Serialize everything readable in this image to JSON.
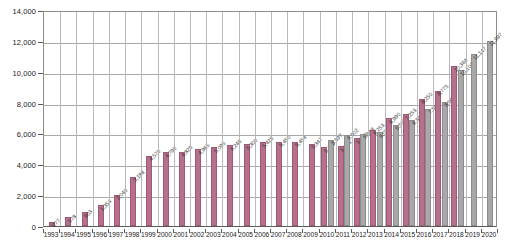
{
  "chart_data": {
    "type": "bar",
    "title": "",
    "subtitle": "",
    "xlabel": "",
    "ylabel": "",
    "ylim": [
      0,
      14000
    ],
    "ytick_values": [
      0,
      2000,
      4000,
      6000,
      8000,
      10000,
      12000,
      14000
    ],
    "ytick_labels": [
      "0",
      "2,000",
      "4,000",
      "6,000",
      "8,000",
      "10,000",
      "12,000",
      "14,000"
    ],
    "grid": true,
    "legend": "none",
    "legend_position": "none",
    "orientation": "vertical",
    "categories": [
      "1993",
      "1994",
      "1995",
      "1996",
      "1997",
      "1998",
      "1999",
      "2000",
      "2001",
      "2002",
      "2003",
      "2004",
      "2005",
      "2006",
      "2007",
      "2008",
      "2009",
      "2010",
      "2011",
      "2012",
      "2013",
      "2014",
      "2015",
      "2016",
      "2017",
      "2018",
      "2019",
      "2020"
    ],
    "series": [
      {
        "name": "pink-series",
        "color": "#b5718c",
        "values": [
          277,
          578,
          903,
          1354,
          2040,
          3188,
          4570,
          4790,
          4825,
          4965,
          5095,
          5246,
          5300,
          5425,
          5450,
          5454,
          5347,
          5119,
          5173,
          5680,
          6253,
          6990,
          7253,
          8250,
          8775,
          10364,
          null,
          null
        ],
        "value_labels": [
          "277",
          "578",
          "903",
          "1,354",
          "2,040",
          "3,188",
          "4,570",
          "4,790",
          "4,825",
          "4,965",
          "5,095",
          "5,246",
          "5,300",
          "5,425",
          "5,450",
          "5,454",
          "5,347",
          "5,119",
          "5,173",
          "5,680",
          "6,253",
          "6,990",
          "7,253",
          "8,250",
          "8,775",
          "10,364",
          "",
          ""
        ]
      },
      {
        "name": "gray-series",
        "color": "#a8a8a8",
        "values": [
          null,
          null,
          null,
          null,
          null,
          null,
          null,
          null,
          null,
          null,
          null,
          null,
          null,
          null,
          null,
          null,
          null,
          5597,
          5902,
          5988,
          6088,
          6575,
          6890,
          7592,
          8065,
          10104,
          11147,
          11997
        ],
        "value_labels": [
          "",
          "",
          "",
          "",
          "",
          "",
          "",
          "",
          "",
          "",
          "",
          "",
          "",
          "",
          "",
          "",
          "",
          "5,597",
          "5,902",
          "5,988",
          "6,088",
          "6,575",
          "6,890",
          "7,592",
          "8,065",
          "10,104",
          "11,147",
          "11,997"
        ]
      }
    ]
  }
}
